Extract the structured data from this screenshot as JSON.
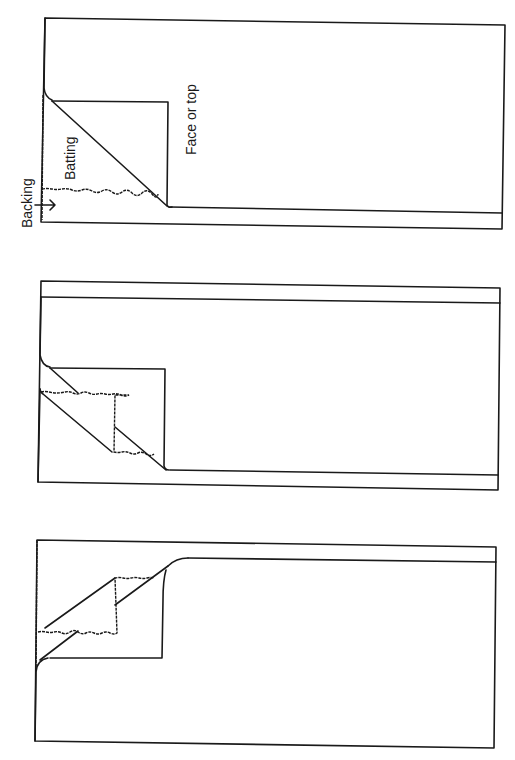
{
  "figure": {
    "panels": [
      {
        "id": "panel-1",
        "description": "Face or top folded diagonally back at corner, revealing batting and backing layers",
        "labels": {
          "backing": "Backing",
          "batting": "Batting",
          "face": "Face or top"
        }
      },
      {
        "id": "panel-2",
        "description": "Face and batting both folded back at corner, staggered"
      },
      {
        "id": "panel-3",
        "description": "Layers folded from the opposite corner, face peeled back over batting"
      }
    ],
    "line_color": "#1a1a1a",
    "background": "#ffffff"
  }
}
